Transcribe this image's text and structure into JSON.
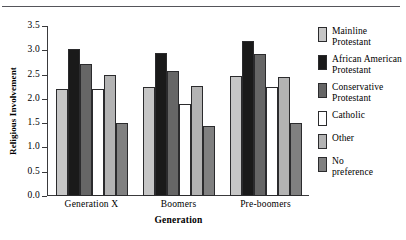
{
  "chart_data": {
    "type": "bar",
    "title": "",
    "xlabel": "Generation",
    "ylabel": "Religious Involvement",
    "categories": [
      "Generation X",
      "Boomers",
      "Pre-boomers"
    ],
    "ylim": [
      0.0,
      3.5
    ],
    "ytick_labels": [
      "0.0",
      "0.5",
      "1.0",
      "1.5",
      "2.0",
      "2.5",
      "3.0",
      "3.5"
    ],
    "ytick_values": [
      0.0,
      0.5,
      1.0,
      1.5,
      2.0,
      2.5,
      3.0,
      3.5
    ],
    "grid": false,
    "legend_position": "right",
    "series": [
      {
        "name": "Mainline\nProtestant",
        "color": "#c6c6c6",
        "values": [
          2.2,
          2.25,
          2.47
        ]
      },
      {
        "name": "African American\nProtestant",
        "color": "#1a1a1a",
        "values": [
          3.02,
          2.95,
          3.2
        ]
      },
      {
        "name": "Conservative\nProtestant",
        "color": "#666666",
        "values": [
          2.72,
          2.58,
          2.92
        ]
      },
      {
        "name": "Catholic",
        "color": "#ffffff",
        "values": [
          2.2,
          1.9,
          2.25
        ]
      },
      {
        "name": "Other",
        "color": "#b3b3b3",
        "values": [
          2.5,
          2.27,
          2.45
        ]
      },
      {
        "name": "No\npreference",
        "color": "#808080",
        "values": [
          1.5,
          1.45,
          1.5
        ]
      }
    ]
  }
}
